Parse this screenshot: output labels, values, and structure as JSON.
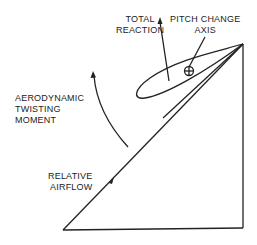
{
  "diagram": {
    "labels": {
      "total_reaction_1": "TOTAL",
      "total_reaction_2": "REACTION",
      "pitch_change_1": "PITCH CHANGE",
      "pitch_change_2": "AXIS",
      "twisting_1": "AERODYNAMIC",
      "twisting_2": "TWISTING",
      "twisting_3": "MOMENT",
      "airflow_1": "RELATIVE",
      "airflow_2": "AIRFLOW"
    },
    "colors": {
      "stroke": "#222222",
      "background": "#ffffff"
    }
  }
}
